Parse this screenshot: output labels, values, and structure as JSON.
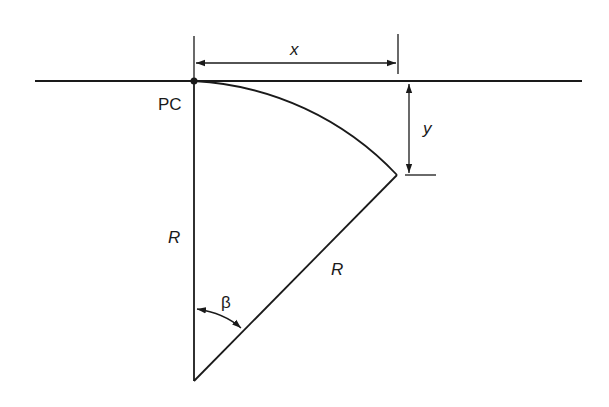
{
  "diagram": {
    "labels": {
      "point_pc": "PC",
      "dim_x": "x",
      "dim_y": "y",
      "radius_vertical": "R",
      "radius_slanted": "R",
      "angle": "β"
    },
    "colors": {
      "stroke": "#1a1a1a",
      "background": "#ffffff"
    }
  }
}
